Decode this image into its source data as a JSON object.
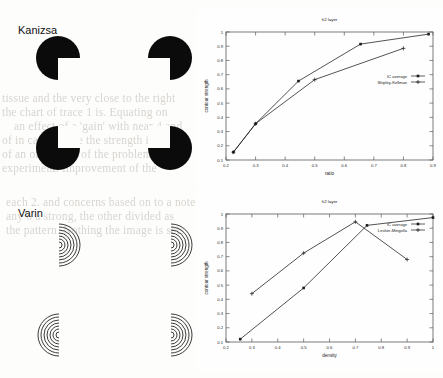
{
  "page": {
    "width": 443,
    "height": 378,
    "background": "#fdfdfc",
    "ink": "#111111"
  },
  "stimuli": [
    {
      "name": "kanizsa",
      "label": "Kanizsa",
      "kind": "pacman-inducers",
      "count": 4,
      "fill": "#0b0b0b"
    },
    {
      "name": "varin",
      "label": "Varin",
      "kind": "concentric-arc-inducers",
      "count": 4,
      "stroke": "#3b3b3b"
    }
  ],
  "bleed_text": [
    {
      "t": "tissue and the very close to the right",
      "x": 2,
      "y": 92,
      "big": false
    },
    {
      "t": "the chart of trace 1 is. Equating on",
      "x": 2,
      "y": 106,
      "big": false
    },
    {
      "t": "an effect of a 'gain' with near 4 and",
      "x": 14,
      "y": 120,
      "big": false
    },
    {
      "t": "of in case simple the strength in the",
      "x": 2,
      "y": 134,
      "big": false
    },
    {
      "t": "of an of the sets of the problem of",
      "x": 2,
      "y": 148,
      "big": false
    },
    {
      "t": "experiment. Improvement of the",
      "x": 2,
      "y": 162,
      "big": false
    },
    {
      "t": "each 2. and concerns based on to a note",
      "x": 6,
      "y": 196,
      "big": false
    },
    {
      "t": "any o   a strong, the other divided as",
      "x": 6,
      "y": 210,
      "big": false
    },
    {
      "t": "the pattern. Nothing the image is sets",
      "x": 6,
      "y": 224,
      "big": false
    },
    {
      "t": "is precisely - model estimate we used as",
      "x": 215,
      "y": 194,
      "big": false
    },
    {
      "t": "the contour was a near to one of the",
      "x": 222,
      "y": 208,
      "big": false
    },
    {
      "t": "and to the contour of a this",
      "x": 236,
      "y": 222,
      "big": false
    },
    {
      "t": "H",
      "x": 398,
      "y": 40,
      "big": true
    },
    {
      "t": "whichever it has denoted of the",
      "x": 238,
      "y": 72,
      "big": false
    },
    {
      "t": "contour of regular that the",
      "x": 240,
      "y": 86,
      "big": false
    },
    {
      "t": "described above such values suggest",
      "x": 232,
      "y": 100,
      "big": false
    },
    {
      "t": "of the each. In implies some pattern",
      "x": 236,
      "y": 114,
      "big": false
    },
    {
      "t": "dominant for both the contour is",
      "x": 238,
      "y": 128,
      "big": false
    },
    {
      "t": "contours in Figure 1 give contrast",
      "x": 236,
      "y": 142,
      "big": false
    },
    {
      "t": "the Hilbert we see a this the it of",
      "x": 234,
      "y": 172,
      "big": false
    },
    {
      "t": "HT",
      "x": 412,
      "y": 62,
      "big": true
    },
    {
      "t": "it one",
      "x": 412,
      "y": 118,
      "big": false
    },
    {
      "t": "a this",
      "x": 414,
      "y": 146,
      "big": false
    }
  ],
  "chart_data": [
    {
      "name": "top-chart",
      "type": "line",
      "title": "h2 layer",
      "xlabel": "ratio",
      "ylabel": "contour strength",
      "xlim": [
        0.2,
        0.9
      ],
      "ylim": [
        0.1,
        1.0
      ],
      "xticks": [
        "0.2",
        "0.3",
        "0.4",
        "0.5",
        "0.6",
        "0.7",
        "0.8",
        "0.9"
      ],
      "yticks": [
        "0.1",
        "0.2",
        "0.3",
        "0.4",
        "0.5",
        "0.6",
        "0.7",
        "0.8",
        "0.9",
        "1"
      ],
      "grid": false,
      "legend_position": "inside-right",
      "series": [
        {
          "name": "IC average",
          "marker": "filled-square",
          "x": [
            0.225,
            0.3,
            0.445,
            0.655,
            0.885
          ],
          "y": [
            0.155,
            0.355,
            0.655,
            0.915,
            0.985
          ]
        },
        {
          "name": "Shipley-Kellman",
          "marker": "plus",
          "x": [
            0.225,
            0.3,
            0.5,
            0.8
          ],
          "y": [
            0.155,
            0.355,
            0.665,
            0.885
          ]
        }
      ]
    },
    {
      "name": "bottom-chart",
      "type": "line",
      "title": "h2 layer",
      "xlabel": "density",
      "ylabel": "contour strength",
      "xlim": [
        0.2,
        1.0
      ],
      "ylim": [
        0.1,
        1.0
      ],
      "xticks": [
        "0.2",
        "0.3",
        "0.4",
        "0.5",
        "0.6",
        "0.7",
        "0.8",
        "0.9",
        "1"
      ],
      "yticks": [
        "0.1",
        "0.2",
        "0.3",
        "0.4",
        "0.5",
        "0.6",
        "0.7",
        "0.8",
        "0.9",
        "1"
      ],
      "grid": false,
      "legend_position": "inside-right",
      "series": [
        {
          "name": "IC average",
          "marker": "filled-square",
          "x": [
            0.255,
            0.5,
            0.745,
            1.0
          ],
          "y": [
            0.12,
            0.48,
            0.92,
            0.975
          ]
        },
        {
          "name": "Lesher-Mingolla",
          "marker": "plus",
          "x": [
            0.3,
            0.5,
            0.7,
            0.9
          ],
          "y": [
            0.44,
            0.725,
            0.945,
            0.68
          ]
        }
      ]
    }
  ]
}
